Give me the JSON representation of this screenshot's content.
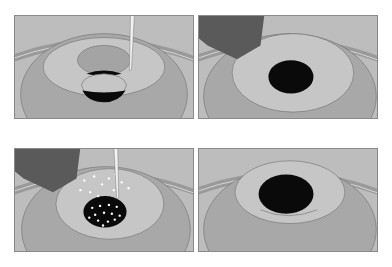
{
  "figure": {
    "layout": "2x2 grid of illustration panels",
    "colors": {
      "background": "#bdbdbd",
      "outer_ring": "#a8a8a8",
      "rim_band": "#9a9a9a",
      "inner_zone": "#c6c6c6",
      "dark_center": "#0a0a0a",
      "instrument": "#5a5a5a",
      "needle": "#f2f2f2",
      "outline": "#6e6e6e",
      "speckle": "#ffffff"
    },
    "panels": [
      {
        "id": "panel-1",
        "position": "top-left",
        "elements": [
          "concentric-rings",
          "ellipse-zone",
          "bulging-lens",
          "needle"
        ]
      },
      {
        "id": "panel-2",
        "position": "top-right",
        "elements": [
          "concentric-rings",
          "dark-center",
          "instrument-tip"
        ]
      },
      {
        "id": "panel-3",
        "position": "bottom-left",
        "elements": [
          "concentric-rings",
          "speckled-dark-center",
          "instrument-tip",
          "needle",
          "white-particles"
        ]
      },
      {
        "id": "panel-4",
        "position": "bottom-right",
        "elements": [
          "concentric-rings",
          "dark-center",
          "raised-disc"
        ]
      }
    ]
  }
}
